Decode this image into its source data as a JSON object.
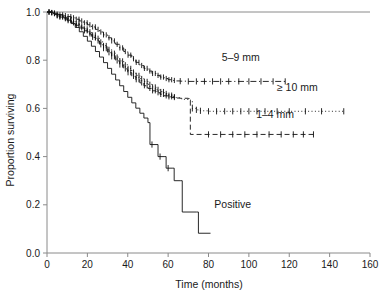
{
  "chart_data": {
    "type": "line",
    "title": "",
    "xlabel": "Time (months)",
    "ylabel": "Proportion surviving",
    "xlim": [
      0,
      160
    ],
    "ylim": [
      0,
      1
    ],
    "xticks": [
      0,
      20,
      40,
      60,
      80,
      100,
      120,
      140,
      160
    ],
    "xticklabels": [
      "0",
      "20",
      "40",
      "60",
      "80",
      "100",
      "120",
      "140",
      "160"
    ],
    "yticks": [
      0.0,
      0.2,
      0.4,
      0.6,
      0.8,
      1.0
    ],
    "yticklabels": [
      "0.0",
      "0.2",
      "0.4",
      "0.6",
      "0.8",
      "1.0"
    ],
    "grid": false,
    "legend": "inline-annotations",
    "series": [
      {
        "name": "5-9 mm",
        "label": "5–9 mm",
        "linestyle": "dashdot",
        "label_x": 96,
        "label_y": 0.795,
        "plateau": 0.712,
        "x_end": 118,
        "points": [
          [
            0,
            1.0
          ],
          [
            2,
            0.998
          ],
          [
            3,
            0.996
          ],
          [
            4,
            0.994
          ],
          [
            5,
            0.991
          ],
          [
            6,
            0.988
          ],
          [
            8,
            0.985
          ],
          [
            10,
            0.981
          ],
          [
            12,
            0.976
          ],
          [
            14,
            0.97
          ],
          [
            16,
            0.963
          ],
          [
            18,
            0.955
          ],
          [
            20,
            0.947
          ],
          [
            22,
            0.938
          ],
          [
            24,
            0.928
          ],
          [
            26,
            0.917
          ],
          [
            28,
            0.905
          ],
          [
            30,
            0.893
          ],
          [
            32,
            0.88
          ],
          [
            34,
            0.866
          ],
          [
            36,
            0.851
          ],
          [
            38,
            0.836
          ],
          [
            40,
            0.821
          ],
          [
            42,
            0.806
          ],
          [
            44,
            0.791
          ],
          [
            46,
            0.778
          ],
          [
            48,
            0.766
          ],
          [
            50,
            0.755
          ],
          [
            52,
            0.745
          ],
          [
            54,
            0.737
          ],
          [
            56,
            0.73
          ],
          [
            58,
            0.724
          ],
          [
            60,
            0.719
          ],
          [
            62,
            0.716
          ],
          [
            64,
            0.714
          ],
          [
            66,
            0.713
          ],
          [
            70,
            0.712
          ],
          [
            80,
            0.712
          ],
          [
            90,
            0.712
          ],
          [
            100,
            0.712
          ],
          [
            110,
            0.712
          ],
          [
            118,
            0.712
          ]
        ],
        "censor_x": [
          66,
          70,
          74,
          78,
          82,
          86,
          90,
          95,
          100,
          106,
          112,
          118
        ]
      },
      {
        "name": ">=10 mm",
        "label": "≥ 10 mm",
        "linestyle": "dotted",
        "label_x": 124,
        "label_y": 0.672,
        "plateau": 0.588,
        "x_end": 147,
        "points": [
          [
            0,
            1.0
          ],
          [
            2,
            0.997
          ],
          [
            3,
            0.994
          ],
          [
            4,
            0.99
          ],
          [
            5,
            0.986
          ],
          [
            6,
            0.981
          ],
          [
            8,
            0.975
          ],
          [
            10,
            0.968
          ],
          [
            12,
            0.96
          ],
          [
            14,
            0.951
          ],
          [
            16,
            0.941
          ],
          [
            18,
            0.93
          ],
          [
            20,
            0.918
          ],
          [
            22,
            0.905
          ],
          [
            24,
            0.891
          ],
          [
            26,
            0.876
          ],
          [
            28,
            0.861
          ],
          [
            30,
            0.845
          ],
          [
            32,
            0.829
          ],
          [
            34,
            0.813
          ],
          [
            36,
            0.797
          ],
          [
            38,
            0.781
          ],
          [
            40,
            0.766
          ],
          [
            42,
            0.751
          ],
          [
            44,
            0.737
          ],
          [
            46,
            0.724
          ],
          [
            48,
            0.712
          ],
          [
            50,
            0.7
          ],
          [
            52,
            0.689
          ],
          [
            54,
            0.679
          ],
          [
            56,
            0.67
          ],
          [
            58,
            0.662
          ],
          [
            60,
            0.655
          ],
          [
            62,
            0.649
          ],
          [
            64,
            0.644
          ],
          [
            66,
            0.64
          ],
          [
            68,
            0.637
          ],
          [
            70,
            0.634
          ],
          [
            72,
            0.6
          ],
          [
            74,
            0.594
          ],
          [
            76,
            0.59
          ],
          [
            80,
            0.588
          ],
          [
            90,
            0.588
          ],
          [
            100,
            0.588
          ],
          [
            110,
            0.588
          ],
          [
            120,
            0.588
          ],
          [
            135,
            0.588
          ],
          [
            147,
            0.588
          ]
        ],
        "censor_x": [
          72,
          74,
          76,
          80,
          84,
          88,
          92,
          96,
          100,
          104,
          108,
          114,
          120,
          128,
          136,
          147
        ]
      },
      {
        "name": "1-4 mm",
        "label": "1–4 mm",
        "linestyle": "dashed",
        "label_x": 113,
        "label_y": 0.562,
        "plateau": 0.492,
        "x_end": 132,
        "points": [
          [
            0,
            1.0
          ],
          [
            2,
            0.997
          ],
          [
            3,
            0.993
          ],
          [
            4,
            0.989
          ],
          [
            5,
            0.984
          ],
          [
            6,
            0.979
          ],
          [
            8,
            0.972
          ],
          [
            10,
            0.964
          ],
          [
            12,
            0.955
          ],
          [
            14,
            0.945
          ],
          [
            16,
            0.934
          ],
          [
            18,
            0.922
          ],
          [
            20,
            0.909
          ],
          [
            22,
            0.895
          ],
          [
            24,
            0.88
          ],
          [
            26,
            0.864
          ],
          [
            28,
            0.848
          ],
          [
            30,
            0.831
          ],
          [
            32,
            0.814
          ],
          [
            34,
            0.797
          ],
          [
            36,
            0.78
          ],
          [
            38,
            0.764
          ],
          [
            40,
            0.748
          ],
          [
            42,
            0.733
          ],
          [
            44,
            0.719
          ],
          [
            46,
            0.706
          ],
          [
            48,
            0.694
          ],
          [
            50,
            0.683
          ],
          [
            52,
            0.673
          ],
          [
            54,
            0.665
          ],
          [
            56,
            0.658
          ],
          [
            58,
            0.652
          ],
          [
            60,
            0.648
          ],
          [
            62,
            0.645
          ],
          [
            64,
            0.643
          ],
          [
            66,
            0.642
          ],
          [
            70,
            0.641
          ],
          [
            71,
            0.492
          ],
          [
            80,
            0.492
          ],
          [
            90,
            0.492
          ],
          [
            100,
            0.492
          ],
          [
            110,
            0.492
          ],
          [
            120,
            0.492
          ],
          [
            132,
            0.492
          ]
        ],
        "censor_x": [
          80,
          86,
          92,
          98,
          104,
          110,
          116,
          122,
          127,
          132
        ]
      },
      {
        "name": "Positive",
        "label": "Positive",
        "linestyle": "solid",
        "label_x": 92,
        "label_y": 0.185,
        "plateau": 0.082,
        "x_end": 81,
        "points": [
          [
            0,
            1.0
          ],
          [
            3,
            0.995
          ],
          [
            5,
            0.988
          ],
          [
            8,
            0.978
          ],
          [
            10,
            0.966
          ],
          [
            12,
            0.952
          ],
          [
            14,
            0.936
          ],
          [
            16,
            0.918
          ],
          [
            18,
            0.899
          ],
          [
            20,
            0.879
          ],
          [
            22,
            0.858
          ],
          [
            24,
            0.836
          ],
          [
            26,
            0.813
          ],
          [
            28,
            0.79
          ],
          [
            30,
            0.766
          ],
          [
            32,
            0.742
          ],
          [
            34,
            0.718
          ],
          [
            36,
            0.694
          ],
          [
            38,
            0.67
          ],
          [
            40,
            0.646
          ],
          [
            42,
            0.623
          ],
          [
            44,
            0.601
          ],
          [
            46,
            0.58
          ],
          [
            48,
            0.56
          ],
          [
            50,
            0.541
          ],
          [
            51,
            0.45
          ],
          [
            54,
            0.45
          ],
          [
            55,
            0.4
          ],
          [
            58,
            0.4
          ],
          [
            59,
            0.352
          ],
          [
            62,
            0.352
          ],
          [
            63,
            0.3
          ],
          [
            66,
            0.3
          ],
          [
            67,
            0.17
          ],
          [
            74,
            0.17
          ],
          [
            75,
            0.082
          ],
          [
            81,
            0.082
          ]
        ],
        "censor_x": [
          52,
          56,
          60
        ]
      }
    ]
  },
  "axes": {
    "y_axis_name": "proportion-surviving-axis",
    "x_axis_name": "time-months-axis"
  }
}
